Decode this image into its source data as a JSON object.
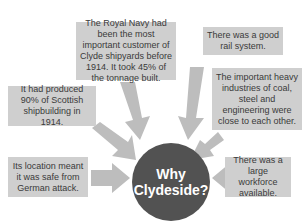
{
  "diagram": {
    "hub": {
      "line1": "Why",
      "line2": "Clydeside?"
    },
    "reasons": [
      {
        "id": "royal-navy",
        "text": "The Royal Navy had been the most important customer of Clyde shipyards before 1914. It took 45% of the tonnage built."
      },
      {
        "id": "rail",
        "text": "There was a good rail system."
      },
      {
        "id": "produced",
        "text": "It had produced 90% of Scottish shipbuilding in 1914."
      },
      {
        "id": "heavy-industry",
        "text": "The important heavy industries of coal, steel and engineering were close to each other."
      },
      {
        "id": "location",
        "text": "Its location meant it was safe from German attack."
      },
      {
        "id": "workforce",
        "text": "There was a large workforce available."
      }
    ],
    "colors": {
      "box": "#cfcfcf",
      "arrow": "#bdbdbd",
      "hub": "#525252",
      "text": "#3a3a3a"
    }
  }
}
